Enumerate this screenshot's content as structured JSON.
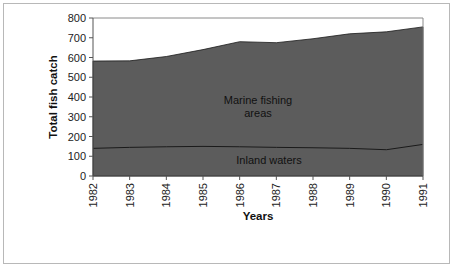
{
  "chart_data": {
    "type": "area",
    "stacked": true,
    "title": "",
    "xlabel": "Years",
    "ylabel": "Total fish catch",
    "ylim": [
      0,
      800
    ],
    "yticks": [
      0,
      100,
      200,
      300,
      400,
      500,
      600,
      700,
      800
    ],
    "categories": [
      "1982",
      "1983",
      "1984",
      "1985",
      "1986",
      "1987",
      "1988",
      "1989",
      "1990",
      "1991"
    ],
    "series": [
      {
        "name": "Inland waters",
        "values": [
          140,
          145,
          148,
          150,
          148,
          145,
          143,
          140,
          133,
          160
        ]
      },
      {
        "name": "Marine fishing areas",
        "values": [
          442,
          438,
          457,
          490,
          532,
          530,
          552,
          580,
          597,
          595
        ]
      }
    ],
    "totals": [
      582,
      583,
      605,
      640,
      680,
      675,
      695,
      720,
      730,
      755
    ],
    "annotations": [
      {
        "text_line1": "Marine fishing",
        "text_line2": "areas"
      },
      {
        "text_line1": "Inland waters"
      }
    ],
    "grid": false,
    "legend": "none (inline labels)",
    "colors": {
      "fill": "#5c5c5c",
      "line": "#1a1a1a",
      "plot_border": "#8a8a8a"
    }
  }
}
